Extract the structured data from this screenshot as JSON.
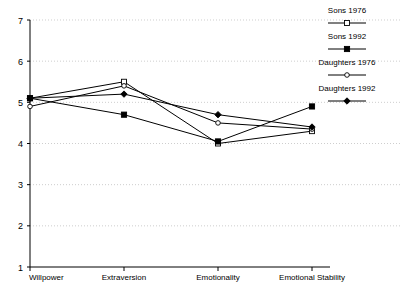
{
  "chart_data": {
    "type": "line",
    "title": "",
    "subtitle": "",
    "xlabel": "",
    "ylabel": "",
    "categories": [
      "Willpower",
      "Extraversion",
      "Emotionality",
      "Emotional Stability"
    ],
    "ylim": [
      1,
      7
    ],
    "yticks": [
      1,
      2,
      3,
      4,
      5,
      6,
      7
    ],
    "ytick_labels": [
      "1",
      "2",
      "3",
      "4",
      "5",
      "6",
      "7"
    ],
    "grid": true,
    "grid_axis": "y",
    "legend_position": "right",
    "series": [
      {
        "name": "Sons 1976",
        "marker": "open-square",
        "color": "#000000",
        "values": [
          5.1,
          5.5,
          4.0,
          4.3
        ]
      },
      {
        "name": "Sons 1992",
        "marker": "filled-square",
        "color": "#000000",
        "values": [
          5.1,
          4.7,
          4.05,
          4.9
        ]
      },
      {
        "name": "Daughters 1976",
        "marker": "open-circle",
        "color": "#000000",
        "values": [
          4.9,
          5.4,
          4.5,
          4.35
        ]
      },
      {
        "name": "Daughters 1992",
        "marker": "filled-diamond",
        "color": "#000000",
        "values": [
          5.1,
          5.2,
          4.7,
          4.4
        ]
      }
    ]
  },
  "legend": {
    "entries": [
      {
        "label": "Sons 1976"
      },
      {
        "label": "Sons 1992"
      },
      {
        "label": "Daughters 1976"
      },
      {
        "label": "Daughters 1992"
      }
    ]
  },
  "axes": {
    "y_tick_labels": [
      "7",
      "6",
      "5",
      "4",
      "3",
      "2",
      "1"
    ],
    "x_tick_labels": [
      "Willpower",
      "Extraversion",
      "Emotionality",
      "Emotional Stability"
    ]
  }
}
